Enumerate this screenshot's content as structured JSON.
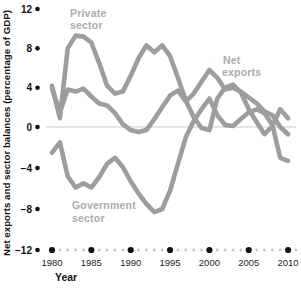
{
  "chart_data": {
    "type": "line",
    "title": "",
    "ylabel": "Net exports and sector balances (percentage of GDP)",
    "xlabel": "Year",
    "xlim": [
      1980,
      2010
    ],
    "ylim": [
      -12,
      12
    ],
    "grid": "zero-baseline only",
    "legend_position": "inline-labels",
    "line_color": "#9d9d9d",
    "series_label_color": "#ababab",
    "zero_line_color": "#cbcbcb",
    "major_dot_color": "#111111",
    "minor_dot_color": "#c6c6c6",
    "yticks": [
      12,
      8,
      4,
      0,
      -4,
      -8,
      -12
    ],
    "ytick_labels": [
      "12",
      "8",
      "4",
      "0",
      "−4",
      "−8",
      "−12"
    ],
    "xticks": [
      1980,
      1985,
      1990,
      1995,
      2000,
      2005,
      2010
    ],
    "xtick_labels": [
      "1980",
      "1985",
      "1990",
      "1995",
      "2000",
      "2005",
      "2010"
    ],
    "x": [
      1980,
      1981,
      1982,
      1983,
      1984,
      1985,
      1986,
      1987,
      1988,
      1989,
      1990,
      1991,
      1992,
      1993,
      1994,
      1995,
      1996,
      1997,
      1998,
      1999,
      2000,
      2001,
      2002,
      2003,
      2004,
      2005,
      2006,
      2007,
      2008,
      2009,
      2010
    ],
    "series": [
      {
        "name": "Private sector",
        "label_lines": [
          "Private",
          "sector"
        ],
        "values": [
          4.2,
          0.9,
          8.0,
          9.3,
          9.2,
          8.6,
          6.5,
          4.2,
          3.4,
          3.6,
          5.2,
          7.0,
          8.3,
          7.6,
          8.3,
          7.2,
          5.0,
          2.7,
          1.0,
          -0.1,
          -0.3,
          2.9,
          4.0,
          4.3,
          3.5,
          1.8,
          0.5,
          -0.7,
          0.1,
          1.8,
          0.9
        ]
      },
      {
        "name": "Net exports",
        "label_lines": [
          "Net",
          "exports"
        ],
        "values": [
          3.9,
          1.5,
          3.8,
          3.6,
          3.9,
          3.1,
          2.4,
          2.2,
          1.4,
          0.3,
          -0.3,
          -0.5,
          -0.3,
          0.8,
          2.0,
          3.2,
          3.7,
          2.6,
          3.4,
          4.6,
          5.8,
          5.0,
          3.8,
          4.0,
          3.6,
          3.0,
          2.4,
          1.6,
          1.2,
          0.0,
          -0.7
        ]
      },
      {
        "name": "Government sector",
        "label_lines": [
          "Government",
          "sector"
        ],
        "values": [
          -2.5,
          -1.5,
          -4.8,
          -5.9,
          -5.5,
          -5.9,
          -4.9,
          -3.6,
          -3.0,
          -3.9,
          -5.3,
          -6.5,
          -7.5,
          -8.3,
          -8.0,
          -6.2,
          -3.6,
          -1.0,
          0.6,
          1.8,
          2.9,
          1.2,
          0.2,
          0.1,
          0.8,
          1.5,
          1.8,
          1.4,
          0.2,
          -3.0,
          -3.3
        ]
      }
    ]
  }
}
